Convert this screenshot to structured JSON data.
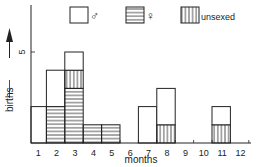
{
  "chart_data": {
    "type": "bar",
    "stacked": true,
    "title": "",
    "xlabel": "months",
    "ylabel": "births",
    "categories": [
      "1",
      "2",
      "3",
      "4",
      "5",
      "6",
      "7",
      "8",
      "9",
      "10",
      "11",
      "12"
    ],
    "series": [
      {
        "name": "female",
        "symbol": "♀",
        "pattern": "horizontal-stripes",
        "values": [
          0,
          2,
          3,
          1,
          1,
          0,
          0,
          0,
          0,
          0,
          0,
          0
        ]
      },
      {
        "name": "unsexed",
        "symbol": "unsexed",
        "pattern": "vertical-stripes",
        "values": [
          0,
          0,
          1,
          0,
          0,
          0,
          0,
          1,
          0,
          0,
          1,
          0
        ]
      },
      {
        "name": "male",
        "symbol": "♂",
        "pattern": "open",
        "values": [
          2,
          2,
          1,
          0,
          0,
          0,
          2,
          2,
          0,
          0,
          1,
          0
        ]
      }
    ],
    "yticks": [
      "5"
    ],
    "ylim": [
      0,
      7
    ],
    "grid": false,
    "legend": {
      "placement": "top",
      "entries": [
        {
          "pattern": "open",
          "label": "♂"
        },
        {
          "pattern": "horizontal-stripes",
          "label": "♀"
        },
        {
          "pattern": "vertical-stripes",
          "label": "unsexed"
        }
      ]
    },
    "colors": {
      "ink": "#222222",
      "background": "#ffffff"
    }
  }
}
